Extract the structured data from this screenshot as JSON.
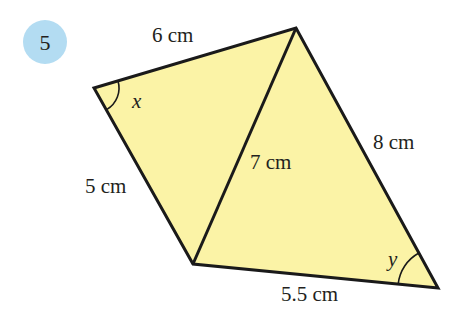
{
  "question": {
    "number": "5",
    "badge_color": "#b3dcf2"
  },
  "figure": {
    "fill_color": "#fbf3a6",
    "stroke_color": "#1a1a1a",
    "vertices": {
      "left": [
        94,
        88
      ],
      "top": [
        296,
        28
      ],
      "bottom": [
        193,
        264
      ],
      "right": [
        438,
        288
      ]
    },
    "side_labels": {
      "top_left": "6 cm",
      "bottom_left": "5 cm",
      "diagonal": "7 cm",
      "top_right": "8 cm",
      "bottom_right": "5.5 cm"
    },
    "angle_labels": {
      "left": "x",
      "right": "y"
    }
  }
}
